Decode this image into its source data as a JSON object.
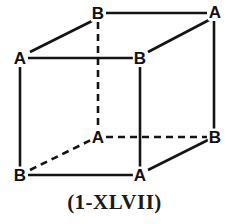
{
  "figure": {
    "caption": "(1-XLVII)",
    "shape": "cube",
    "projection": "oblique",
    "stroke_color": "#141414",
    "background_color": "#ffffff",
    "solid_stroke_width": 2.6,
    "dashed_stroke_width": 2.6,
    "dash_pattern": "7,5",
    "vertices": [
      {
        "id": "back-top-left",
        "label": "B",
        "x": 98,
        "y": 13,
        "hidden": true
      },
      {
        "id": "back-top-right",
        "label": "A",
        "x": 215,
        "y": 12,
        "hidden": false
      },
      {
        "id": "front-top-left",
        "label": "A",
        "x": 20,
        "y": 58,
        "hidden": false
      },
      {
        "id": "front-top-right",
        "label": "B",
        "x": 140,
        "y": 58,
        "hidden": false
      },
      {
        "id": "back-bottom-left",
        "label": "A",
        "x": 98,
        "y": 137,
        "hidden": true
      },
      {
        "id": "back-bottom-right",
        "label": "B",
        "x": 215,
        "y": 137,
        "hidden": false
      },
      {
        "id": "front-bottom-left",
        "label": "B",
        "x": 20,
        "y": 175,
        "hidden": false
      },
      {
        "id": "front-bottom-right",
        "label": "A",
        "x": 140,
        "y": 175,
        "hidden": false
      }
    ],
    "edges": [
      {
        "id": "top-back-horizontal",
        "x1": 106,
        "y1": 13,
        "x2": 207,
        "y2": 13,
        "style": "solid"
      },
      {
        "id": "top-front-horizontal",
        "x1": 28,
        "y1": 58,
        "x2": 133,
        "y2": 58,
        "style": "solid"
      },
      {
        "id": "bottom-front-horizontal",
        "x1": 28,
        "y1": 175,
        "x2": 133,
        "y2": 175,
        "style": "solid"
      },
      {
        "id": "bottom-back-horizontal",
        "x1": 106,
        "y1": 137,
        "x2": 207,
        "y2": 137,
        "style": "dashed"
      },
      {
        "id": "left-front-vertical",
        "x1": 20,
        "y1": 67,
        "x2": 20,
        "y2": 167,
        "style": "solid"
      },
      {
        "id": "middle-front-vertical",
        "x1": 140,
        "y1": 67,
        "x2": 140,
        "y2": 167,
        "style": "solid"
      },
      {
        "id": "right-back-vertical",
        "x1": 214,
        "y1": 21,
        "x2": 214,
        "y2": 129,
        "style": "solid"
      },
      {
        "id": "left-back-vertical",
        "x1": 98,
        "y1": 22,
        "x2": 98,
        "y2": 128,
        "style": "dashed"
      },
      {
        "id": "top-left-diagonal",
        "x1": 30,
        "y1": 52,
        "x2": 92,
        "y2": 21,
        "style": "solid"
      },
      {
        "id": "top-right-diagonal",
        "x1": 148,
        "y1": 52,
        "x2": 209,
        "y2": 20,
        "style": "solid"
      },
      {
        "id": "bottom-right-diagonal",
        "x1": 148,
        "y1": 170,
        "x2": 208,
        "y2": 140,
        "style": "solid"
      },
      {
        "id": "bottom-left-diagonal",
        "x1": 30,
        "y1": 170,
        "x2": 91,
        "y2": 140,
        "style": "dashed"
      }
    ]
  }
}
